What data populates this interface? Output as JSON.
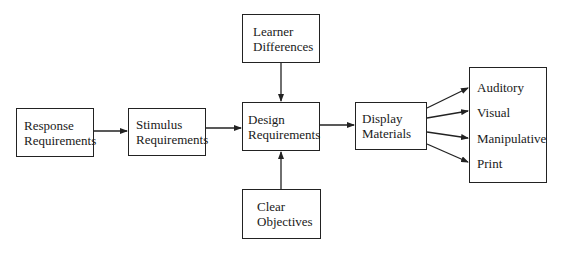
{
  "diagram": {
    "nodes": [
      {
        "id": "response",
        "lines": [
          "Response",
          "Requirements"
        ]
      },
      {
        "id": "stimulus",
        "lines": [
          "Stimulus",
          "Requirements"
        ]
      },
      {
        "id": "learner",
        "lines": [
          "Learner",
          "Differences"
        ]
      },
      {
        "id": "design",
        "lines": [
          "Design",
          "Requirements"
        ]
      },
      {
        "id": "objectives",
        "lines": [
          "Clear",
          "Objectives"
        ]
      },
      {
        "id": "display",
        "lines": [
          "Display",
          "Materials"
        ]
      }
    ],
    "outputs": [
      "Auditory",
      "Visual",
      "Manipulative",
      "Print"
    ],
    "edges": [
      {
        "from": "response",
        "to": "stimulus"
      },
      {
        "from": "stimulus",
        "to": "design"
      },
      {
        "from": "learner",
        "to": "design"
      },
      {
        "from": "objectives",
        "to": "design"
      },
      {
        "from": "design",
        "to": "display"
      },
      {
        "from": "display",
        "to": "Auditory"
      },
      {
        "from": "display",
        "to": "Visual"
      },
      {
        "from": "display",
        "to": "Manipulative"
      },
      {
        "from": "display",
        "to": "Print"
      }
    ]
  }
}
